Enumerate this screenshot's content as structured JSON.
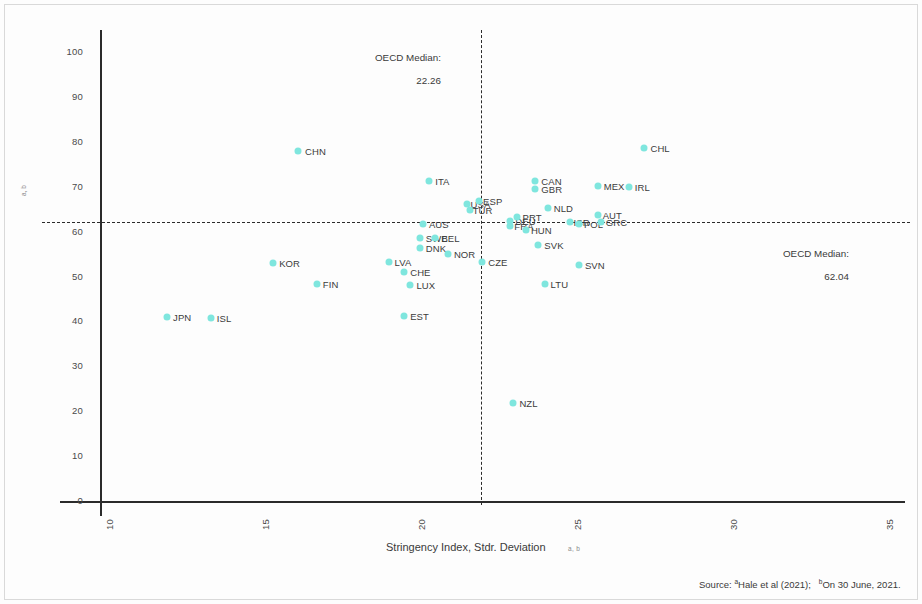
{
  "figure": {
    "x_axis": {
      "title": "Stringency Index, Stdr. Deviation",
      "superscript": "a, b",
      "ticks": [
        "10",
        "15",
        "20",
        "25",
        "30",
        "35"
      ],
      "min": 10,
      "max": 35
    },
    "y_axis": {
      "title": "Stringency Index, Average",
      "superscript": "a, b",
      "ticks": [
        "0",
        "10",
        "20",
        "30",
        "40",
        "50",
        "60",
        "70",
        "80",
        "90",
        "100"
      ],
      "min": 0,
      "max": 100
    },
    "annotations": {
      "vertical_median": {
        "title": "OECD Median:",
        "value": "22.26"
      },
      "horizontal_median": {
        "title": "OECD Median:",
        "value": "62.04"
      }
    },
    "source": {
      "prefix": "Source:",
      "sup_a": "a",
      "ref_a": "Hale et al (2021);",
      "sup_b": "b",
      "ref_b": "On 30 June, 2021."
    },
    "colors": {
      "marker": "#7fe6de",
      "axis": "#2b2b2b",
      "text": "#3a3a3a"
    }
  },
  "chart_data": {
    "type": "scatter",
    "title": "",
    "xlabel": "Stringency Index, Stdr. Deviation",
    "ylabel": "Stringency Index, Average",
    "xlim": [
      10,
      35
    ],
    "ylim": [
      0,
      100
    ],
    "grid": false,
    "legend": null,
    "reference_lines": [
      {
        "orientation": "vertical",
        "value": 22.26,
        "label": "OECD Median: 22.26",
        "style": "dashed"
      },
      {
        "orientation": "horizontal",
        "value": 62.04,
        "label": "OECD Median: 62.04",
        "style": "dashed"
      }
    ],
    "points": [
      {
        "label": "JPN",
        "x": 12.15,
        "y": 41.0,
        "lx": 6,
        "ly": -5
      },
      {
        "label": "ISL",
        "x": 13.55,
        "y": 40.8,
        "lx": 6,
        "ly": -5
      },
      {
        "label": "KOR",
        "x": 15.55,
        "y": 53.0,
        "lx": 6,
        "ly": -5
      },
      {
        "label": "CHN",
        "x": 16.35,
        "y": 78.0,
        "lx": 7,
        "ly": -5
      },
      {
        "label": "FIN",
        "x": 16.95,
        "y": 48.3,
        "lx": 6,
        "ly": -5
      },
      {
        "label": "LVA",
        "x": 19.25,
        "y": 53.2,
        "lx": 6,
        "ly": -5
      },
      {
        "label": "CHE",
        "x": 19.75,
        "y": 51.0,
        "lx": 6,
        "ly": -5
      },
      {
        "label": "LUX",
        "x": 19.95,
        "y": 48.0,
        "lx": 6,
        "ly": -5
      },
      {
        "label": "EST",
        "x": 19.75,
        "y": 41.2,
        "lx": 6,
        "ly": -5
      },
      {
        "label": "ITA",
        "x": 20.55,
        "y": 71.3,
        "lx": 6,
        "ly": -5
      },
      {
        "label": "AUS",
        "x": 20.35,
        "y": 61.8,
        "lx": 6,
        "ly": -5
      },
      {
        "label": "SWE",
        "x": 20.25,
        "y": 58.6,
        "lx": 6,
        "ly": -5
      },
      {
        "label": "BEL",
        "x": 20.75,
        "y": 58.6,
        "lx": 6,
        "ly": -5
      },
      {
        "label": "DNK",
        "x": 20.25,
        "y": 56.4,
        "lx": 6,
        "ly": -5
      },
      {
        "label": "NOR",
        "x": 21.15,
        "y": 55.0,
        "lx": 6,
        "ly": -5
      },
      {
        "label": "USA",
        "x": 21.75,
        "y": 66.2,
        "lx": 4,
        "ly": -5
      },
      {
        "label": "ESP",
        "x": 22.15,
        "y": 66.8,
        "lx": 4,
        "ly": -5
      },
      {
        "label": "TUR",
        "x": 21.85,
        "y": 64.8,
        "lx": 3,
        "ly": -5
      },
      {
        "label": "CZE",
        "x": 22.25,
        "y": 53.2,
        "lx": 6,
        "ly": -5
      },
      {
        "label": "DEU",
        "x": 23.15,
        "y": 62.4,
        "lx": 5,
        "ly": -5
      },
      {
        "label": "PRT",
        "x": 23.35,
        "y": 63.2,
        "lx": 6,
        "ly": -5
      },
      {
        "label": "FRA",
        "x": 23.15,
        "y": 61.2,
        "lx": 4,
        "ly": -5
      },
      {
        "label": "HUN",
        "x": 23.65,
        "y": 60.4,
        "lx": 5,
        "ly": -5
      },
      {
        "label": "GBR",
        "x": 23.95,
        "y": 69.4,
        "lx": 6,
        "ly": -5
      },
      {
        "label": "CAN",
        "x": 23.95,
        "y": 71.3,
        "lx": 6,
        "ly": -5
      },
      {
        "label": "NLD",
        "x": 24.35,
        "y": 65.2,
        "lx": 6,
        "ly": -5
      },
      {
        "label": "SVK",
        "x": 24.05,
        "y": 57.0,
        "lx": 6,
        "ly": -5
      },
      {
        "label": "LTU",
        "x": 24.25,
        "y": 48.4,
        "lx": 6,
        "ly": -5
      },
      {
        "label": "NZL",
        "x": 23.25,
        "y": 21.8,
        "lx": 6,
        "ly": -5
      },
      {
        "label": "ISR",
        "x": 25.05,
        "y": 62.2,
        "lx": 4,
        "ly": -5
      },
      {
        "label": "POL",
        "x": 25.35,
        "y": 61.6,
        "lx": 5,
        "ly": -5
      },
      {
        "label": "SVN",
        "x": 25.35,
        "y": 52.6,
        "lx": 6,
        "ly": -5
      },
      {
        "label": "AUT",
        "x": 25.95,
        "y": 63.6,
        "lx": 5,
        "ly": -5
      },
      {
        "label": "GRC",
        "x": 26.05,
        "y": 62.2,
        "lx": 5,
        "ly": -5
      },
      {
        "label": "MEX",
        "x": 25.95,
        "y": 70.2,
        "lx": 6,
        "ly": -5
      },
      {
        "label": "IRL",
        "x": 26.95,
        "y": 70.0,
        "lx": 6,
        "ly": -5
      },
      {
        "label": "CHL",
        "x": 27.45,
        "y": 78.6,
        "lx": 6,
        "ly": -5
      }
    ]
  }
}
